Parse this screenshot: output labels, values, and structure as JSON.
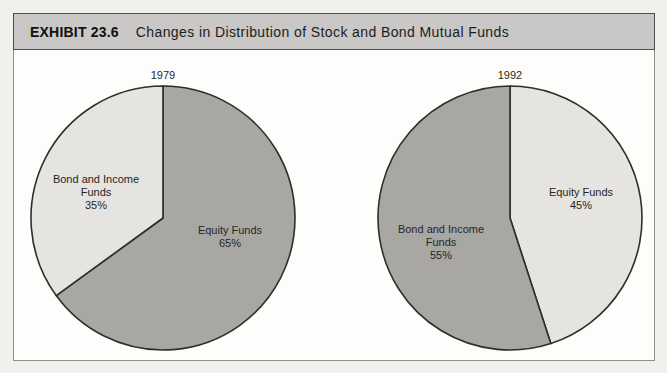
{
  "header": {
    "exhibit_label": "EXHIBIT 23.6",
    "title": "Changes in Distribution of Stock and Bond Mutual Funds"
  },
  "styles": {
    "page_bg": "#f1f0ec",
    "header_bg": "#c9c8c6",
    "body_bg": "#fdfdfb",
    "slice_stroke": "#2e2e2c",
    "light_slice_color": "#e5e4e0",
    "dark_slice_color": "#a8a7a4"
  },
  "chart_data": [
    {
      "type": "pie",
      "title": "1979",
      "start_angle_deg": 0,
      "direction": "clockwise",
      "legend": "none",
      "slices": [
        {
          "label": "Equity Funds",
          "value": 65,
          "color": "#a8a7a4",
          "label_lines": [
            "Equity Funds",
            "65%"
          ]
        },
        {
          "label": "Bond and Income Funds",
          "value": 35,
          "color": "#e5e4e0",
          "label_lines": [
            "Bond and Income",
            "Funds",
            "35%"
          ]
        }
      ]
    },
    {
      "type": "pie",
      "title": "1992",
      "start_angle_deg": 0,
      "direction": "clockwise",
      "legend": "none",
      "slices": [
        {
          "label": "Equity Funds",
          "value": 45,
          "color": "#e5e4e0",
          "label_lines": [
            "Equity Funds",
            "45%"
          ]
        },
        {
          "label": "Bond and Income Funds",
          "value": 55,
          "color": "#a8a7a4",
          "label_lines": [
            "Bond and Income",
            "Funds",
            "55%"
          ]
        }
      ]
    }
  ]
}
